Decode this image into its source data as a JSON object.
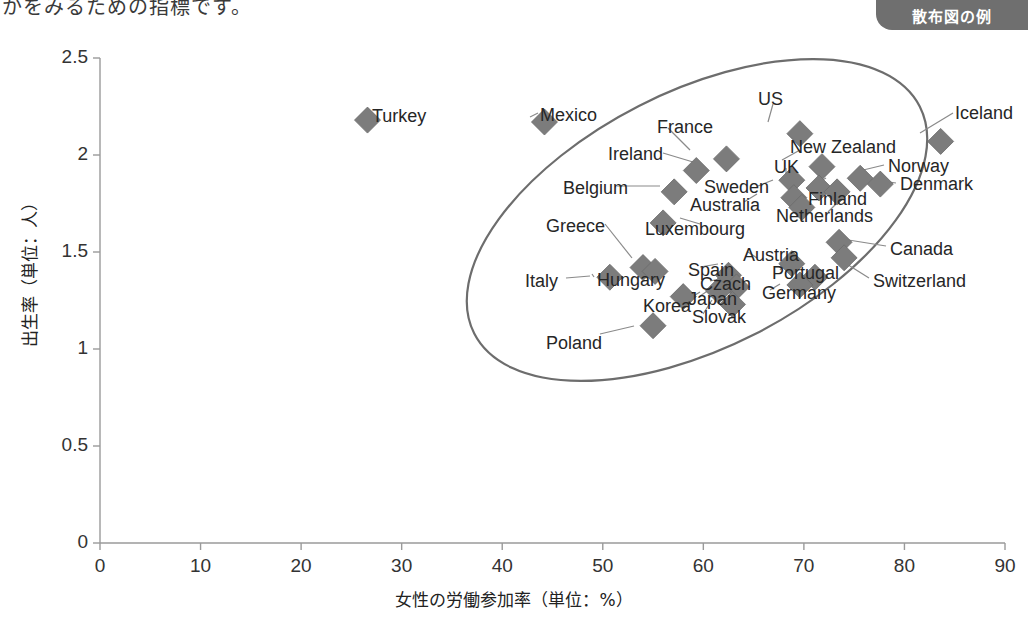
{
  "page": {
    "top_truncated_text": "かをみるための指標です。",
    "badge_label": "散布図の例"
  },
  "chart_data": {
    "type": "scatter",
    "title": "",
    "xlabel": "女性の労働参加率（単位：%）",
    "ylabel": "出生率（単位：人）",
    "xlim": [
      0,
      90
    ],
    "ylim": [
      0,
      2.5
    ],
    "xticks": [
      0,
      10,
      20,
      30,
      40,
      50,
      60,
      70,
      80,
      90
    ],
    "yticks": [
      0,
      0.5,
      1,
      1.5,
      2,
      2.5
    ],
    "grid": false,
    "legend": "none",
    "marker": "diamond",
    "marker_color": "#7c7c7c",
    "annotation": {
      "shape": "ellipse",
      "description": "rotated ellipse enclosing the main correlation cluster"
    },
    "points": [
      {
        "label": "Turkey",
        "x": 26.6,
        "y": 2.18,
        "lx": 372,
        "ly": 107,
        "anchor": "left"
      },
      {
        "label": "Mexico",
        "x": 44.2,
        "y": 2.17,
        "lx": 540,
        "ly": 106,
        "anchor": "left"
      },
      {
        "label": "US",
        "x": 69.6,
        "y": 2.11,
        "lx": 758,
        "ly": 90,
        "anchor": "left"
      },
      {
        "label": "Iceland",
        "x": 83.6,
        "y": 2.07,
        "lx": 955,
        "ly": 104,
        "anchor": "left"
      },
      {
        "label": "France",
        "x": 62.3,
        "y": 1.98,
        "lx": 657,
        "ly": 118,
        "anchor": "left"
      },
      {
        "label": "New Zealand",
        "x": 71.8,
        "y": 1.94,
        "lx": 790,
        "ly": 138,
        "anchor": "left"
      },
      {
        "label": "Ireland",
        "x": 59.3,
        "y": 1.92,
        "lx": 608,
        "ly": 145,
        "anchor": "left"
      },
      {
        "label": "Norway",
        "x": 75.6,
        "y": 1.88,
        "lx": 888,
        "ly": 157,
        "anchor": "left"
      },
      {
        "label": "UK",
        "x": 68.8,
        "y": 1.87,
        "lx": 774,
        "ly": 158,
        "anchor": "left"
      },
      {
        "label": "Denmark",
        "x": 77.6,
        "y": 1.85,
        "lx": 900,
        "ly": 175,
        "anchor": "left"
      },
      {
        "label": "Sweden",
        "x": 71.5,
        "y": 1.83,
        "lx": 704,
        "ly": 178,
        "anchor": "left"
      },
      {
        "label": "Finland",
        "x": 73.3,
        "y": 1.81,
        "lx": 808,
        "ly": 190,
        "anchor": "left"
      },
      {
        "label": "Belgium",
        "x": 57.1,
        "y": 1.81,
        "lx": 563,
        "ly": 179,
        "anchor": "left"
      },
      {
        "label": "Australia",
        "x": 69.0,
        "y": 1.78,
        "lx": 690,
        "ly": 196,
        "anchor": "left"
      },
      {
        "label": "Netherlands",
        "x": 69.8,
        "y": 1.73,
        "lx": 776,
        "ly": 207,
        "anchor": "left"
      },
      {
        "label": "Luxembourg",
        "x": 56.0,
        "y": 1.65,
        "lx": 645,
        "ly": 220,
        "anchor": "left"
      },
      {
        "label": "Canada",
        "x": 73.5,
        "y": 1.55,
        "lx": 890,
        "ly": 240,
        "anchor": "left"
      },
      {
        "label": "Greece",
        "x": 54.0,
        "y": 1.42,
        "lx": 546,
        "ly": 217,
        "anchor": "left"
      },
      {
        "label": "Switzerland",
        "x": 74.0,
        "y": 1.47,
        "lx": 873,
        "ly": 272,
        "anchor": "left"
      },
      {
        "label": "Austria",
        "x": 68.8,
        "y": 1.44,
        "lx": 743,
        "ly": 246,
        "anchor": "left"
      },
      {
        "label": "Hungary",
        "x": 55.2,
        "y": 1.4,
        "lx": 597,
        "ly": 271,
        "anchor": "left"
      },
      {
        "label": "Spain",
        "x": 62.5,
        "y": 1.38,
        "lx": 688,
        "ly": 261,
        "anchor": "left"
      },
      {
        "label": "Portugal",
        "x": 71.1,
        "y": 1.37,
        "lx": 772,
        "ly": 264,
        "anchor": "left"
      },
      {
        "label": "Italy",
        "x": 50.7,
        "y": 1.37,
        "lx": 525,
        "ly": 272,
        "anchor": "left"
      },
      {
        "label": "Germany",
        "x": 69.6,
        "y": 1.33,
        "lx": 762,
        "ly": 284,
        "anchor": "left"
      },
      {
        "label": "Czach",
        "x": 63.3,
        "y": 1.32,
        "lx": 700,
        "ly": 275,
        "anchor": "left"
      },
      {
        "label": "Japan",
        "x": 61.5,
        "y": 1.3,
        "lx": 688,
        "ly": 290,
        "anchor": "left"
      },
      {
        "label": "Korea",
        "x": 58.0,
        "y": 1.27,
        "lx": 643,
        "ly": 297,
        "anchor": "left"
      },
      {
        "label": "Slovak",
        "x": 62.9,
        "y": 1.23,
        "lx": 692,
        "ly": 308,
        "anchor": "left"
      },
      {
        "label": "Poland",
        "x": 55.0,
        "y": 1.12,
        "lx": 546,
        "ly": 334,
        "anchor": "left"
      }
    ],
    "leader_lines": [
      {
        "from": [
          372,
          114
        ],
        "to": [
          362,
          117
        ]
      },
      {
        "from": [
          538,
          113
        ],
        "to": [
          530,
          117
        ]
      },
      {
        "from": [
          773,
          104
        ],
        "to": [
          768,
          122
        ]
      },
      {
        "from": [
          953,
          113
        ],
        "to": [
          920,
          133
        ]
      },
      {
        "from": [
          668,
          128
        ],
        "to": [
          690,
          150
        ]
      },
      {
        "from": [
          800,
          150
        ],
        "to": [
          782,
          160
        ]
      },
      {
        "from": [
          663,
          153
        ],
        "to": [
          693,
          162
        ]
      },
      {
        "from": [
          884,
          165
        ],
        "to": [
          855,
          172
        ]
      },
      {
        "from": [
          786,
          168
        ],
        "to": [
          786,
          176
        ]
      },
      {
        "from": [
          896,
          183
        ],
        "to": [
          862,
          178
        ]
      },
      {
        "from": [
          758,
          186
        ],
        "to": [
          773,
          180
        ]
      },
      {
        "from": [
          816,
          184
        ],
        "to": [
          826,
          178
        ]
      },
      {
        "from": [
          617,
          186
        ],
        "to": [
          660,
          186
        ]
      },
      {
        "from": [
          744,
          202
        ],
        "to": [
          757,
          194
        ]
      },
      {
        "from": [
          828,
          212
        ],
        "to": [
          840,
          200
        ]
      },
      {
        "from": [
          700,
          224
        ],
        "to": [
          680,
          218
        ]
      },
      {
        "from": [
          886,
          246
        ],
        "to": [
          836,
          238
        ]
      },
      {
        "from": [
          605,
          224
        ],
        "to": [
          632,
          258
        ]
      },
      {
        "from": [
          869,
          278
        ],
        "to": [
          834,
          256
        ]
      },
      {
        "from": [
          748,
          252
        ],
        "to": [
          757,
          258
        ]
      },
      {
        "from": [
          594,
          277
        ],
        "to": [
          592,
          274
        ]
      },
      {
        "from": [
          700,
          267
        ],
        "to": [
          718,
          264
        ]
      },
      {
        "from": [
          780,
          270
        ],
        "to": [
          784,
          266
        ]
      },
      {
        "from": [
          566,
          278
        ],
        "to": [
          590,
          276
        ]
      },
      {
        "from": [
          770,
          290
        ],
        "to": [
          780,
          284
        ]
      },
      {
        "from": [
          710,
          281
        ],
        "to": [
          724,
          278
        ]
      },
      {
        "from": [
          700,
          296
        ],
        "to": [
          712,
          288
        ]
      },
      {
        "from": [
          682,
          303
        ],
        "to": [
          700,
          292
        ]
      },
      {
        "from": [
          703,
          314
        ],
        "to": [
          712,
          300
        ]
      },
      {
        "from": [
          600,
          334
        ],
        "to": [
          634,
          326
        ]
      }
    ]
  }
}
